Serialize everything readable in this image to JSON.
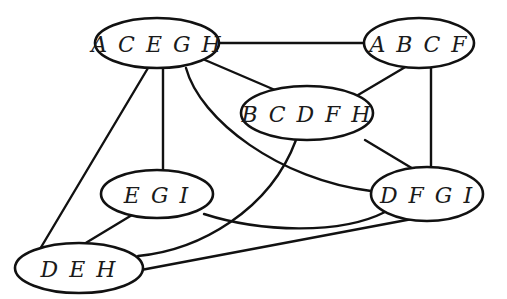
{
  "diagram": {
    "type": "graph",
    "background": "#ffffff",
    "stroke_color": "#111111",
    "nodes": [
      {
        "id": "ACEGH",
        "label": "A C E G H",
        "cx": 157,
        "cy": 43,
        "rx": 62,
        "ry": 25
      },
      {
        "id": "ABCF",
        "label": "A B C F",
        "cx": 419,
        "cy": 43,
        "rx": 55,
        "ry": 25
      },
      {
        "id": "BCDFH",
        "label": "B C D F H",
        "cx": 307,
        "cy": 113,
        "rx": 66,
        "ry": 27
      },
      {
        "id": "EGI",
        "label": "E G I",
        "cx": 157,
        "cy": 194,
        "rx": 56,
        "ry": 24
      },
      {
        "id": "DFGI",
        "label": "D F G I",
        "cx": 427,
        "cy": 194,
        "rx": 56,
        "ry": 27
      },
      {
        "id": "DEH",
        "label": "D E H",
        "cx": 79,
        "cy": 268,
        "rx": 64,
        "ry": 25
      }
    ],
    "edges": [
      {
        "from": "ACEGH",
        "to": "ABCF"
      },
      {
        "from": "ACEGH",
        "to": "BCDFH"
      },
      {
        "from": "ACEGH",
        "to": "EGI"
      },
      {
        "from": "ACEGH",
        "to": "DFGI"
      },
      {
        "from": "ACEGH",
        "to": "DEH"
      },
      {
        "from": "ABCF",
        "to": "BCDFH"
      },
      {
        "from": "ABCF",
        "to": "DFGI"
      },
      {
        "from": "BCDFH",
        "to": "DFGI"
      },
      {
        "from": "BCDFH",
        "to": "DEH"
      },
      {
        "from": "EGI",
        "to": "DFGI"
      },
      {
        "from": "EGI",
        "to": "DEH"
      },
      {
        "from": "DFGI",
        "to": "DEH"
      }
    ]
  }
}
